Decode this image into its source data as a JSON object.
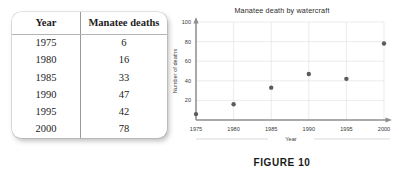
{
  "table": {
    "headers": [
      "Year",
      "Manatee deaths"
    ],
    "rows": [
      {
        "year": "1975",
        "deaths": "6"
      },
      {
        "year": "1980",
        "deaths": "16"
      },
      {
        "year": "1985",
        "deaths": "33"
      },
      {
        "year": "1990",
        "deaths": "47"
      },
      {
        "year": "1995",
        "deaths": "42"
      },
      {
        "year": "2000",
        "deaths": "78"
      }
    ]
  },
  "caption": "FIGURE 10",
  "chart_data": {
    "type": "scatter",
    "title": "Manatee death by watercraft",
    "xlabel": "Year",
    "ylabel": "Number of deaths",
    "x": [
      1975,
      1980,
      1985,
      1990,
      1995,
      2000
    ],
    "values": [
      6,
      16,
      33,
      47,
      42,
      78
    ],
    "xticks": [
      "1975",
      "1980",
      "1985",
      "1990",
      "1995",
      "2000"
    ],
    "yticks": [
      "20",
      "40",
      "60",
      "80",
      "100"
    ],
    "xlim": [
      1975,
      2000
    ],
    "ylim": [
      0,
      100
    ],
    "grid": true,
    "legend": "none",
    "marker_color": "#5c5c5c"
  }
}
